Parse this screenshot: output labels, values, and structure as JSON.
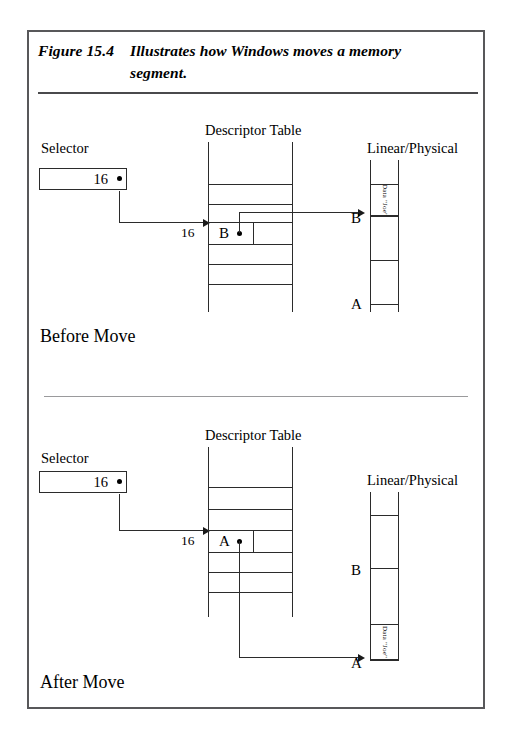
{
  "figure": {
    "caption_label": "Figure 15.4",
    "caption_line1": "Illustrates how Windows moves a memory",
    "caption_line2": "segment."
  },
  "panels": [
    {
      "id": "before",
      "state_label": "Before Move",
      "selector": {
        "title": "Selector",
        "value": "16"
      },
      "selector_arrow_value": "16",
      "descriptor_table": {
        "title": "Descriptor Table",
        "highlighted_row_letter": "B",
        "row_count": 6
      },
      "memory": {
        "title": "Linear/Physical",
        "data_block_label": "Data \"Joe\"",
        "marker_top": "B",
        "marker_bottom": "A"
      }
    },
    {
      "id": "after",
      "state_label": "After Move",
      "selector": {
        "title": "Selector",
        "value": "16"
      },
      "selector_arrow_value": "16",
      "descriptor_table": {
        "title": "Descriptor Table",
        "highlighted_row_letter": "A",
        "row_count": 6
      },
      "memory": {
        "title": "Linear/Physical",
        "data_block_label": "Data \"Joe\"",
        "marker_top": "B",
        "marker_bottom": "A"
      }
    }
  ]
}
